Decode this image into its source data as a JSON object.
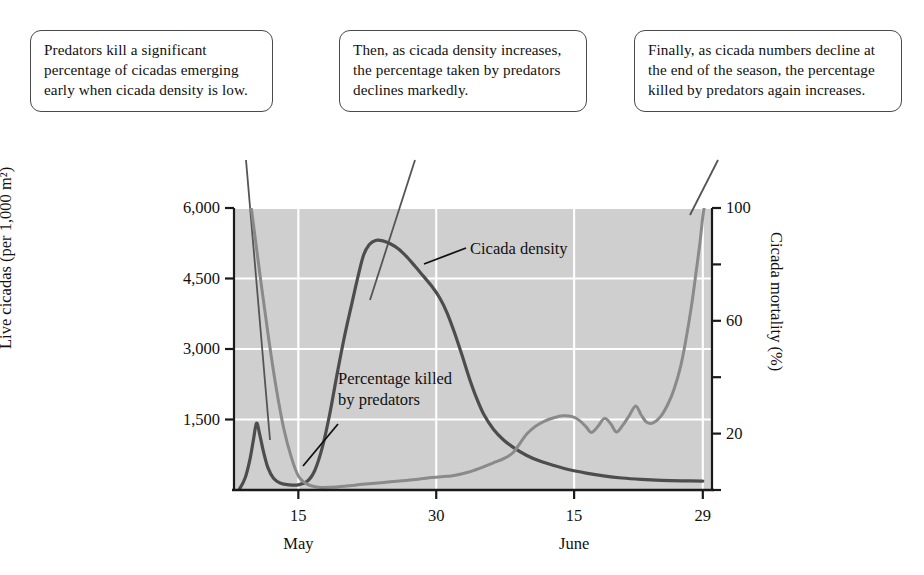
{
  "callouts": [
    {
      "id": "callout-1",
      "text": "Predators kill a significant percentage of cicadas emerging early when cicada density is low."
    },
    {
      "id": "callout-2",
      "text": "Then, as cicada density increases, the percentage taken by predators declines markedly."
    },
    {
      "id": "callout-3",
      "text": "Finally, as cicada numbers decline at the end of the season, the percentage killed by predators again increases."
    }
  ],
  "chart_data": {
    "type": "line",
    "title": "",
    "xlabel": "",
    "ylabel": "Live cicadas (per 1,000 m²)",
    "y2label": "Cicada mortality (%)",
    "grid": true,
    "legend_position": "inline-annotation",
    "plot_background": "#cfcfcf",
    "gridline_color": "#ffffff",
    "x_axis": {
      "label": "",
      "range": [
        8,
        60
      ],
      "tick_values": [
        15,
        30,
        45,
        59
      ],
      "tick_labels": [
        "15",
        "30",
        "15",
        "29"
      ],
      "month_labels": [
        {
          "text": "May",
          "at": 15
        },
        {
          "text": "June",
          "at": 45
        }
      ]
    },
    "y_axis_left": {
      "label": "Live cicadas (per 1,000 m²)",
      "range": [
        0,
        6000
      ],
      "tick_values": [
        1500,
        3000,
        4500,
        6000
      ],
      "tick_labels": [
        "1,500",
        "3,000",
        "4,500",
        "6,000"
      ]
    },
    "y_axis_right": {
      "label": "Cicada mortality (%)",
      "range": [
        0,
        100
      ],
      "tick_values": [
        0,
        20,
        40,
        60,
        80,
        100
      ],
      "tick_labels": [
        "",
        "20",
        "",
        "60",
        "",
        "100"
      ]
    },
    "series": [
      {
        "name": "Cicada density",
        "axis": "left",
        "color": "#4d4d4d",
        "width": 3.2,
        "label_position": {
          "x": 470,
          "y": 238
        },
        "points": [
          [
            8.6,
            20
          ],
          [
            9.2,
            250
          ],
          [
            9.7,
            620
          ],
          [
            10.1,
            1050
          ],
          [
            10.45,
            1420
          ],
          [
            10.8,
            1180
          ],
          [
            11.2,
            820
          ],
          [
            11.7,
            470
          ],
          [
            12.3,
            250
          ],
          [
            13.0,
            150
          ],
          [
            14.0,
            110
          ],
          [
            15.0,
            110
          ],
          [
            16.0,
            190
          ],
          [
            16.8,
            420
          ],
          [
            17.6,
            900
          ],
          [
            18.4,
            1600
          ],
          [
            19.2,
            2450
          ],
          [
            20.0,
            3250
          ],
          [
            20.8,
            3950
          ],
          [
            21.5,
            4550
          ],
          [
            22.1,
            5000
          ],
          [
            22.7,
            5220
          ],
          [
            23.4,
            5310
          ],
          [
            24.2,
            5300
          ],
          [
            25.0,
            5240
          ],
          [
            25.9,
            5130
          ],
          [
            26.8,
            4960
          ],
          [
            27.7,
            4760
          ],
          [
            28.6,
            4550
          ],
          [
            29.5,
            4340
          ],
          [
            30.4,
            4080
          ],
          [
            31.2,
            3760
          ],
          [
            32.0,
            3340
          ],
          [
            32.8,
            2870
          ],
          [
            33.6,
            2380
          ],
          [
            34.4,
            1950
          ],
          [
            35.2,
            1600
          ],
          [
            36.2,
            1300
          ],
          [
            37.3,
            1070
          ],
          [
            38.5,
            890
          ],
          [
            39.8,
            740
          ],
          [
            41.2,
            620
          ],
          [
            42.8,
            520
          ],
          [
            44.5,
            430
          ],
          [
            46.3,
            360
          ],
          [
            48.2,
            300
          ],
          [
            50.2,
            255
          ],
          [
            52.3,
            225
          ],
          [
            54.5,
            205
          ],
          [
            56.8,
            195
          ],
          [
            59.0,
            190
          ]
        ]
      },
      {
        "name": "Percentage killed by predators",
        "axis": "right",
        "color": "#8a8a8a",
        "width": 3.0,
        "label_position": {
          "x": 338,
          "y": 368
        },
        "label_text": "Percentage killed by predators",
        "points": [
          [
            8.6,
            132
          ],
          [
            9.4,
            112
          ],
          [
            10.2,
            92
          ],
          [
            11.0,
            72
          ],
          [
            11.8,
            53
          ],
          [
            12.6,
            36
          ],
          [
            13.4,
            22
          ],
          [
            14.2,
            12
          ],
          [
            15.0,
            5
          ],
          [
            16.0,
            2
          ],
          [
            17.2,
            1
          ],
          [
            18.6,
            1
          ],
          [
            20.2,
            1.4
          ],
          [
            22.0,
            2
          ],
          [
            24.0,
            2.6
          ],
          [
            26.0,
            3.2
          ],
          [
            28.0,
            3.8
          ],
          [
            29.5,
            4.4
          ],
          [
            30.8,
            4.8
          ],
          [
            31.6,
            5.0
          ],
          [
            32.6,
            5.6
          ],
          [
            33.8,
            6.6
          ],
          [
            35.0,
            8.0
          ],
          [
            36.2,
            9.6
          ],
          [
            37.4,
            11.2
          ],
          [
            38.4,
            13.4
          ],
          [
            39.2,
            17.0
          ],
          [
            39.9,
            20.0
          ],
          [
            40.8,
            22.6
          ],
          [
            41.8,
            24.4
          ],
          [
            42.8,
            25.6
          ],
          [
            43.8,
            26.3
          ],
          [
            44.8,
            26.0
          ],
          [
            45.6,
            24.6
          ],
          [
            46.3,
            22.4
          ],
          [
            46.9,
            20.4
          ],
          [
            47.6,
            22.6
          ],
          [
            48.3,
            25.4
          ],
          [
            49.0,
            23.4
          ],
          [
            49.6,
            20.6
          ],
          [
            50.3,
            23.0
          ],
          [
            51.0,
            26.4
          ],
          [
            51.7,
            29.8
          ],
          [
            52.3,
            26.6
          ],
          [
            52.9,
            24.0
          ],
          [
            53.6,
            23.8
          ],
          [
            54.4,
            26.0
          ],
          [
            55.2,
            30.4
          ],
          [
            55.9,
            36.0
          ],
          [
            56.6,
            44.0
          ],
          [
            57.2,
            54.0
          ],
          [
            57.8,
            66.0
          ],
          [
            58.3,
            78.0
          ],
          [
            58.7,
            88.0
          ],
          [
            59.0,
            97.0
          ],
          [
            59.2,
            101
          ]
        ]
      }
    ],
    "annotations": [
      {
        "text": "Cicada density",
        "type": "series-label"
      },
      {
        "text": "Percentage killed by predators",
        "type": "series-label"
      }
    ]
  }
}
